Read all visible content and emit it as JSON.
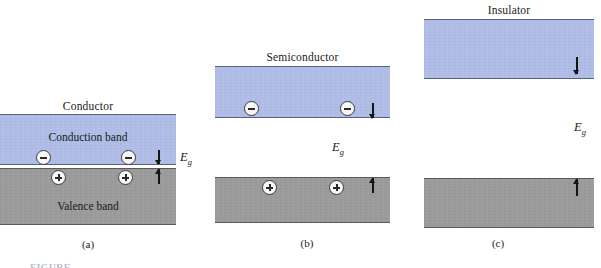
{
  "figure": {
    "panels": [
      {
        "id": "a",
        "title": "Conductor",
        "caption": "(a)",
        "conduction_label": "Conduction band",
        "valence_label": "Valence band",
        "gap_symbol": "E",
        "gap_subscript": "g",
        "electrons": 2,
        "holes": 2,
        "electron_sign": "minus",
        "hole_sign": "plus",
        "gap_size": "zero"
      },
      {
        "id": "b",
        "title": "Semiconductor",
        "caption": "(b)",
        "conduction_label": "",
        "valence_label": "",
        "gap_symbol": "E",
        "gap_subscript": "g",
        "electrons": 2,
        "holes": 2,
        "electron_sign": "minus",
        "hole_sign": "plus",
        "gap_size": "small"
      },
      {
        "id": "c",
        "title": "Insulator",
        "caption": "(c)",
        "conduction_label": "",
        "valence_label": "",
        "gap_symbol": "E",
        "gap_subscript": "g",
        "electrons": 0,
        "holes": 0,
        "electron_sign": "minus",
        "hole_sign": "plus",
        "gap_size": "large"
      }
    ],
    "figure_caption": "FIGURE",
    "colors": {
      "conduction_band": "#b0bde8",
      "valence_band": "#9b9b9b",
      "band_outline": "#5a6280",
      "carrier_fill": "#f7f7f5",
      "ink": "#1a1a1a",
      "background": "#ffffff"
    }
  }
}
